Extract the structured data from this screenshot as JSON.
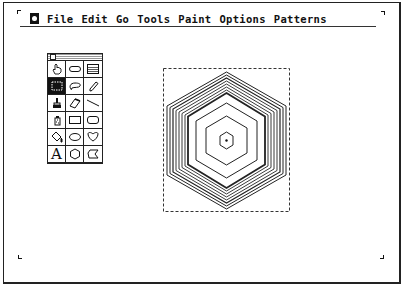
{
  "menubar": {
    "apple_icon": "apple-menu-icon",
    "items": [
      {
        "label": "File"
      },
      {
        "label": "Edit"
      },
      {
        "label": "Go"
      },
      {
        "label": "Tools"
      },
      {
        "label": "Paint"
      },
      {
        "label": "Options"
      },
      {
        "label": "Patterns"
      }
    ]
  },
  "tools_palette": {
    "selected_tool": "select",
    "tools": [
      {
        "name": "browse",
        "icon": "hand-icon"
      },
      {
        "name": "button",
        "icon": "button-icon"
      },
      {
        "name": "field",
        "icon": "field-icon"
      },
      {
        "name": "select",
        "icon": "select-icon"
      },
      {
        "name": "lasso",
        "icon": "lasso-icon"
      },
      {
        "name": "pencil",
        "icon": "pencil-icon"
      },
      {
        "name": "brush",
        "icon": "brush-icon"
      },
      {
        "name": "eraser",
        "icon": "eraser-icon"
      },
      {
        "name": "line",
        "icon": "line-icon"
      },
      {
        "name": "spray",
        "icon": "spray-can-icon"
      },
      {
        "name": "rectangle",
        "icon": "rectangle-icon"
      },
      {
        "name": "round-rect",
        "icon": "rounded-rectangle-icon"
      },
      {
        "name": "bucket",
        "icon": "paint-bucket-icon"
      },
      {
        "name": "oval",
        "icon": "oval-icon"
      },
      {
        "name": "curve",
        "icon": "curve-icon"
      },
      {
        "name": "text",
        "icon": "text-icon",
        "glyph": "A"
      },
      {
        "name": "regular-polygon",
        "icon": "polygon-icon"
      },
      {
        "name": "polygon",
        "icon": "irregular-polygon-icon"
      }
    ]
  },
  "canvas": {
    "selection": {
      "x": 163,
      "y": 68,
      "width": 127,
      "height": 144
    },
    "shape": "concentric-hexagons",
    "hexagon_count": 12
  }
}
